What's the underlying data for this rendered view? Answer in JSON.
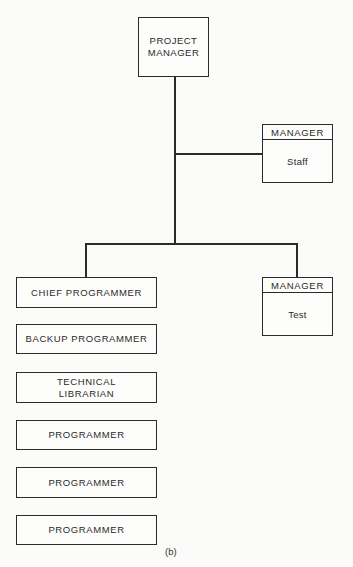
{
  "diagram": {
    "type": "org-chart",
    "caption": "(b)",
    "root": {
      "label_line1": "PROJECT",
      "label_line2": "MANAGER"
    },
    "staff_manager": {
      "header": "MANAGER",
      "body": "Staff"
    },
    "test_manager": {
      "header": "MANAGER",
      "body": "Test"
    },
    "team": [
      {
        "label": "CHIEF PROGRAMMER"
      },
      {
        "label": "BACKUP PROGRAMMER"
      },
      {
        "label_line1": "TECHNICAL",
        "label_line2": "LIBRARIAN"
      },
      {
        "label": "PROGRAMMER"
      },
      {
        "label": "PROGRAMMER"
      },
      {
        "label": "PROGRAMMER"
      }
    ],
    "relationships": [
      {
        "from": "PROJECT MANAGER",
        "to": "MANAGER Staff"
      },
      {
        "from": "PROJECT MANAGER",
        "to": "CHIEF PROGRAMMER"
      },
      {
        "from": "PROJECT MANAGER",
        "to": "MANAGER Test"
      }
    ]
  }
}
